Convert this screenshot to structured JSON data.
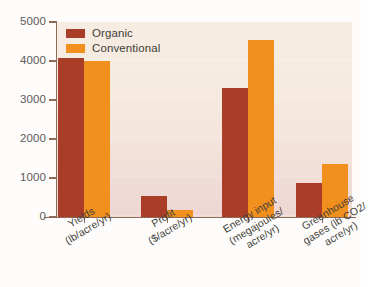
{
  "chart_data": {
    "type": "bar",
    "title": "",
    "subtitle": "",
    "xlabel": "",
    "ylabel": "",
    "ylim": [
      0,
      5000
    ],
    "yticks": [
      0,
      1000,
      2000,
      3000,
      4000,
      5000
    ],
    "ytick_labels": [
      "0",
      "1000",
      "2000",
      "3000",
      "4000",
      "5000"
    ],
    "grid": false,
    "legend_position": "top-left",
    "categories": [
      "Yields (lb/acre/yr)",
      "Profit ($/acre/yr)",
      "Energy input (megajoules/acre/yr)",
      "Greenhouse gases (lb CO2/acre/yr)"
    ],
    "category_lines": [
      [
        "Yields",
        "(lb/acre/yr)"
      ],
      [
        "Profit",
        "($/acre/yr)"
      ],
      [
        "Energy input",
        "(megajoules/",
        "acre/yr)"
      ],
      [
        "Greenhouse",
        "gases (lb CO2/",
        "acre/yr)"
      ]
    ],
    "series": [
      {
        "name": "Organic",
        "color": "#a93d28",
        "values": [
          4070,
          540,
          3300,
          880
        ]
      },
      {
        "name": "Conventional",
        "color": "#f2901e",
        "values": [
          3990,
          180,
          4550,
          1370
        ]
      }
    ]
  },
  "legend": {
    "items": [
      {
        "label": "Organic"
      },
      {
        "label": "Conventional"
      }
    ]
  },
  "colors": {
    "organic": "#a93d28",
    "conventional": "#f2901e",
    "axis": "#8d6b58",
    "text": "#3f3c39",
    "tick_text": "#5d5a57",
    "plot_bg_top": "#f6ece1",
    "plot_bg_bottom": "#eed6d2",
    "page_bg": "#fdfcfa"
  }
}
